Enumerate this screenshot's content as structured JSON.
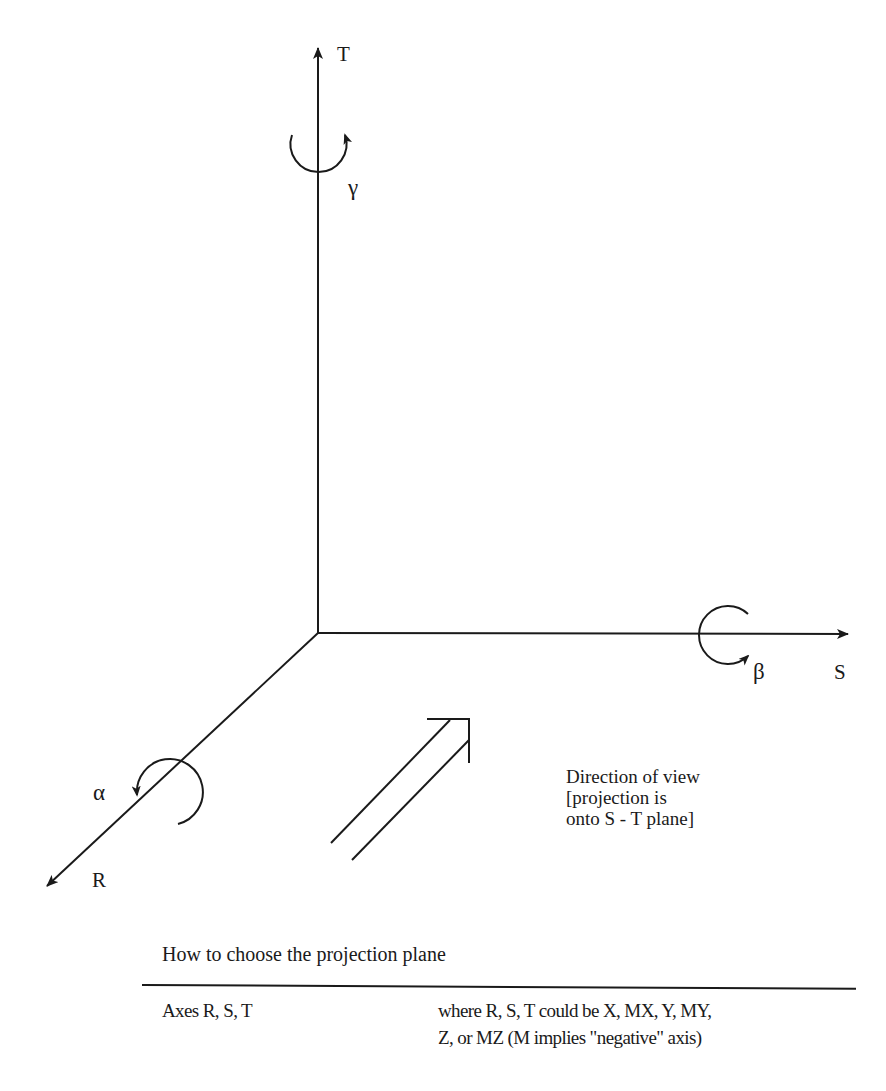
{
  "diagram": {
    "axes": {
      "T": {
        "label": "T",
        "direction": "up"
      },
      "S": {
        "label": "S",
        "direction": "right"
      },
      "R": {
        "label": "R",
        "direction": "down-left (toward viewer)"
      }
    },
    "rotations": {
      "alpha": {
        "symbol": "α",
        "about_axis": "R"
      },
      "beta": {
        "symbol": "β",
        "about_axis": "S"
      },
      "gamma": {
        "symbol": "γ",
        "about_axis": "T"
      }
    },
    "view_arrow": {
      "lines": [
        "Direction of view",
        "[projection is",
        "onto S - T plane]"
      ]
    },
    "colors": {
      "ink": "#1a1a1a",
      "background": "#ffffff"
    }
  },
  "table": {
    "caption": "How to choose the projection plane",
    "rows": [
      {
        "key": "Axes R, S, T",
        "value_lines": [
          "where R, S, T could be X, MX, Y, MY,",
          "Z, or MZ (M implies \"negative\" axis)"
        ]
      }
    ]
  }
}
